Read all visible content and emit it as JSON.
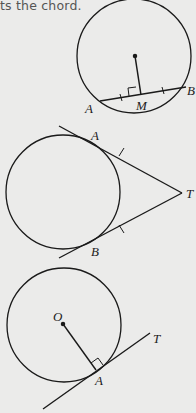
{
  "caption": {
    "text": "ts the chord."
  },
  "figures": [
    {
      "id": "chord-perpendicular-bisector",
      "circle": {
        "cx": 134,
        "cy": 56,
        "r": 57
      },
      "center_dot": {
        "x": 135,
        "y": 56
      },
      "chord": {
        "A": [
          101,
          101
        ],
        "B": [
          185,
          87
        ]
      },
      "midpoint": {
        "M": [
          141,
          95
        ]
      },
      "labels": {
        "A": "A",
        "B": "B",
        "M": "M"
      }
    },
    {
      "id": "two-tangents-from-external-point",
      "circle": {
        "cx": 63,
        "cy": 192,
        "r": 57
      },
      "point_T": [
        182,
        193
      ],
      "labels": {
        "A": "A",
        "B": "B",
        "T": "T"
      }
    },
    {
      "id": "tangent-perpendicular-to-radius",
      "circle": {
        "cx": 64,
        "cy": 325,
        "r": 57
      },
      "center_dot": {
        "x": 63,
        "y": 324
      },
      "point_A": [
        97,
        371
      ],
      "labels": {
        "O": "O",
        "A": "A",
        "T": "T"
      }
    }
  ],
  "colors": {
    "stroke": "#1a1a1a",
    "background": "#ebebea",
    "caption": "#555555"
  }
}
